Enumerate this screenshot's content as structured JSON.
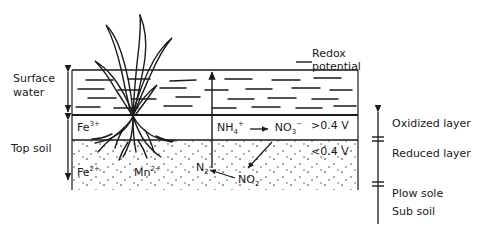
{
  "figure": {
    "ink_color": "#1a1a1a",
    "background": "#ffffff"
  },
  "left_labels": {
    "surface_water_line1": "Surface",
    "surface_water_line2": "water",
    "top_soil": "Top soil"
  },
  "profile_labels": {
    "fe3": "Fe",
    "fe3_charge": "3+",
    "fe2": "Fe",
    "fe2_charge": "2+",
    "mn2": "Mn",
    "mn2_charge": "2+"
  },
  "reactions": {
    "nh4": "NH",
    "nh4_sub": "4",
    "nh4_sup": "+",
    "no3": "NO",
    "no3_sub": "3",
    "no3_sup": "−",
    "no2": "NO",
    "no2_sub": "2",
    "n2": "N",
    "n2_sub": "2",
    "arrow": "→"
  },
  "redox": {
    "label_line1": "Redox",
    "label_line2": "potential",
    "oxidized_voltage": ">0.4 V",
    "reduced_voltage": "<0.4 V"
  },
  "right_labels": {
    "oxidized_layer": "Oxidized layer",
    "reduced_layer": "Reduced layer",
    "plow_sole": "Plow sole",
    "sub_soil": "Sub soil"
  },
  "icons": {
    "plant": "rice-plant-icon",
    "water": "water-dashes-icon",
    "stipple": "soil-stipple-icon",
    "redox_arrow": "up-arrow-icon"
  }
}
